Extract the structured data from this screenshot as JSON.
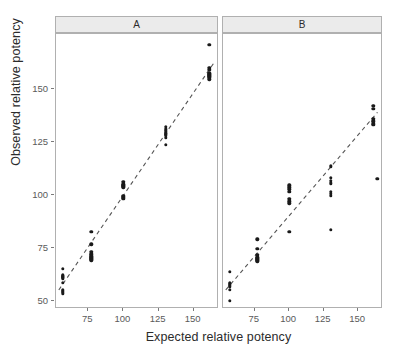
{
  "chart_data": {
    "type": "scatter",
    "title": "",
    "xlabel": "Expected relative potency",
    "ylabel": "Observed relative potency",
    "xlim": [
      52,
      168
    ],
    "ylim": [
      46,
      176
    ],
    "xticks": [
      75,
      100,
      125,
      150
    ],
    "yticks": [
      50,
      75,
      100,
      125,
      150
    ],
    "grid": false,
    "legend": null,
    "facets": [
      {
        "label": "A",
        "points": [
          {
            "x": 57,
            "y": 65.0
          },
          {
            "x": 57,
            "y": 62.0
          },
          {
            "x": 57,
            "y": 61.5
          },
          {
            "x": 57,
            "y": 61.0
          },
          {
            "x": 57,
            "y": 60.5
          },
          {
            "x": 57,
            "y": 58.5
          },
          {
            "x": 57,
            "y": 55.0
          },
          {
            "x": 57,
            "y": 54.5
          },
          {
            "x": 57,
            "y": 54.0
          },
          {
            "x": 57,
            "y": 53.5
          },
          {
            "x": 77,
            "y": 82.5
          },
          {
            "x": 77,
            "y": 76.5
          },
          {
            "x": 77,
            "y": 73.0
          },
          {
            "x": 77,
            "y": 72.0
          },
          {
            "x": 77,
            "y": 71.5
          },
          {
            "x": 77,
            "y": 71.0
          },
          {
            "x": 77,
            "y": 70.5
          },
          {
            "x": 77,
            "y": 70.0
          },
          {
            "x": 77,
            "y": 69.5
          },
          {
            "x": 77,
            "y": 69.0
          },
          {
            "x": 100,
            "y": 106.0
          },
          {
            "x": 100,
            "y": 105.0
          },
          {
            "x": 100,
            "y": 104.5
          },
          {
            "x": 100,
            "y": 104.0
          },
          {
            "x": 100,
            "y": 103.5
          },
          {
            "x": 100,
            "y": 99.5
          },
          {
            "x": 100,
            "y": 99.0
          },
          {
            "x": 100,
            "y": 98.5
          },
          {
            "x": 100,
            "y": 98.0
          },
          {
            "x": 130,
            "y": 132.0
          },
          {
            "x": 130,
            "y": 131.0
          },
          {
            "x": 130,
            "y": 130.0
          },
          {
            "x": 130,
            "y": 129.0
          },
          {
            "x": 130,
            "y": 128.5
          },
          {
            "x": 130,
            "y": 128.0
          },
          {
            "x": 130,
            "y": 127.0
          },
          {
            "x": 130,
            "y": 123.5
          },
          {
            "x": 161,
            "y": 171.0
          },
          {
            "x": 161,
            "y": 160.0
          },
          {
            "x": 161,
            "y": 159.0
          },
          {
            "x": 161,
            "y": 157.5
          },
          {
            "x": 161,
            "y": 157.0
          },
          {
            "x": 161,
            "y": 156.5
          },
          {
            "x": 161,
            "y": 156.0
          },
          {
            "x": 161,
            "y": 155.5
          },
          {
            "x": 161,
            "y": 154.5
          }
        ],
        "fit_line": {
          "x0": 54,
          "y0": 55.0,
          "x1": 164,
          "y1": 162.0
        }
      },
      {
        "label": "B",
        "points": [
          {
            "x": 57,
            "y": 63.5
          },
          {
            "x": 57,
            "y": 58.5
          },
          {
            "x": 57,
            "y": 58.0
          },
          {
            "x": 57,
            "y": 57.5
          },
          {
            "x": 57,
            "y": 57.0
          },
          {
            "x": 57,
            "y": 56.5
          },
          {
            "x": 57,
            "y": 55.0
          },
          {
            "x": 57,
            "y": 50.0
          },
          {
            "x": 77,
            "y": 79.0
          },
          {
            "x": 77,
            "y": 74.5
          },
          {
            "x": 77,
            "y": 71.5
          },
          {
            "x": 77,
            "y": 70.5
          },
          {
            "x": 77,
            "y": 70.0
          },
          {
            "x": 77,
            "y": 69.5
          },
          {
            "x": 77,
            "y": 69.0
          },
          {
            "x": 77,
            "y": 68.5
          },
          {
            "x": 100,
            "y": 104.5
          },
          {
            "x": 100,
            "y": 103.5
          },
          {
            "x": 100,
            "y": 102.5
          },
          {
            "x": 100,
            "y": 101.5
          },
          {
            "x": 100,
            "y": 98.0
          },
          {
            "x": 100,
            "y": 97.0
          },
          {
            "x": 100,
            "y": 96.0
          },
          {
            "x": 100,
            "y": 82.5
          },
          {
            "x": 130,
            "y": 113.5
          },
          {
            "x": 130,
            "y": 108.0
          },
          {
            "x": 130,
            "y": 106.5
          },
          {
            "x": 130,
            "y": 105.5
          },
          {
            "x": 130,
            "y": 101.5
          },
          {
            "x": 130,
            "y": 100.5
          },
          {
            "x": 130,
            "y": 99.5
          },
          {
            "x": 130,
            "y": 83.5
          },
          {
            "x": 161,
            "y": 142.0
          },
          {
            "x": 161,
            "y": 140.5
          },
          {
            "x": 161,
            "y": 136.0
          },
          {
            "x": 161,
            "y": 135.0
          },
          {
            "x": 161,
            "y": 134.5
          },
          {
            "x": 161,
            "y": 133.5
          },
          {
            "x": 161,
            "y": 133.0
          },
          {
            "x": 164,
            "y": 107.5
          }
        ],
        "fit_line": {
          "x0": 54,
          "y0": 55.0,
          "x1": 164,
          "y1": 139.0
        }
      }
    ],
    "point_color": "#1a1a1a",
    "fit_line_color": "#555555",
    "fit_line_style": "dashed",
    "strip_background": "#ebebeb",
    "panel_border": "#b0b0b0"
  }
}
